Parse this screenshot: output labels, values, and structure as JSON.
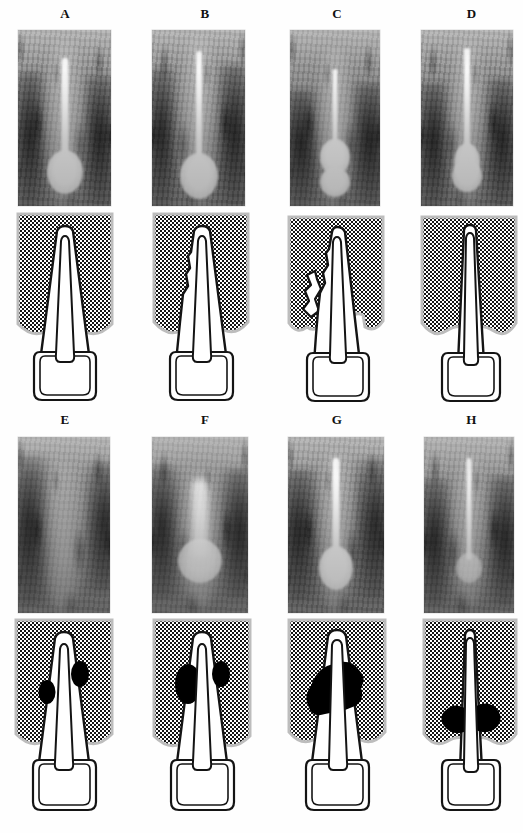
{
  "figure": {
    "caption_present": false,
    "rows": 2,
    "columns": 4,
    "panel_count": 8,
    "background_color": "#ffffff",
    "ink_color": "#111111",
    "lesion_color": "#000000",
    "bone_stipple_color": "#1a1a1a"
  },
  "panels": [
    {
      "label": "A",
      "row": 0,
      "column": 0,
      "radiograph": {
        "name": "periapical-radiograph-a"
      },
      "diagram": {
        "name": "tooth-schematic-a",
        "root_shape": "wide-tapered",
        "canal_width": "narrow",
        "bone_defect": "none",
        "lesion": "none"
      }
    },
    {
      "label": "B",
      "row": 0,
      "column": 1,
      "radiograph": {
        "name": "periapical-radiograph-b"
      },
      "diagram": {
        "name": "tooth-schematic-b",
        "root_shape": "wide-tapered",
        "canal_width": "narrow",
        "bone_defect": "slight-irregular-crest",
        "lesion": "none"
      }
    },
    {
      "label": "C",
      "row": 0,
      "column": 2,
      "radiograph": {
        "name": "periapical-radiograph-c"
      },
      "diagram": {
        "name": "tooth-schematic-c",
        "root_shape": "narrow-tapered",
        "canal_width": "narrow",
        "bone_defect": "lateral-notch-defect",
        "lesion": "none"
      }
    },
    {
      "label": "D",
      "row": 0,
      "column": 3,
      "radiograph": {
        "name": "periapical-radiograph-d"
      },
      "diagram": {
        "name": "tooth-schematic-d",
        "root_shape": "slender",
        "canal_width": "wide",
        "bone_defect": "none",
        "lesion": "none"
      }
    },
    {
      "label": "E",
      "row": 1,
      "column": 0,
      "radiograph": {
        "name": "periapical-radiograph-e"
      },
      "diagram": {
        "name": "tooth-schematic-e",
        "root_shape": "wide-tapered",
        "canal_width": "narrow",
        "bone_defect": "none",
        "lesion": "two-small-lateral-radiolucencies"
      }
    },
    {
      "label": "F",
      "row": 1,
      "column": 1,
      "radiograph": {
        "name": "periapical-radiograph-f"
      },
      "diagram": {
        "name": "tooth-schematic-f",
        "root_shape": "wide-tapered",
        "canal_width": "narrow",
        "bone_defect": "none",
        "lesion": "two-medium-lateral-radiolucencies"
      }
    },
    {
      "label": "G",
      "row": 1,
      "column": 2,
      "radiograph": {
        "name": "periapical-radiograph-g"
      },
      "diagram": {
        "name": "tooth-schematic-g",
        "root_shape": "wide-tapered",
        "canal_width": "wide",
        "bone_defect": "none",
        "lesion": "large-confluent-periradicular-radiolucency"
      }
    },
    {
      "label": "H",
      "row": 1,
      "column": 3,
      "radiograph": {
        "name": "periapical-radiograph-h"
      },
      "diagram": {
        "name": "tooth-schematic-h",
        "root_shape": "slender",
        "canal_width": "wide",
        "bone_defect": "none",
        "lesion": "bilateral-cervical-radiolucency"
      }
    }
  ]
}
